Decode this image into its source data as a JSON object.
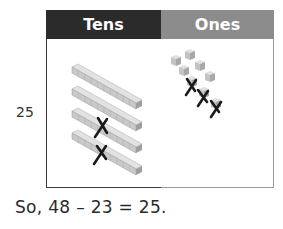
{
  "table": {
    "headers": [
      {
        "label": "Tens",
        "color": "#2b2b2b"
      },
      {
        "label": "Ones",
        "color": "#8c8c8c"
      }
    ],
    "row_label": "25",
    "tens": {
      "rods_total": 4,
      "rods_crossed_out": 2
    },
    "ones": {
      "cubes_total": 8,
      "cubes_crossed_out": 3
    }
  },
  "equation": "So, 48 – 23 = 25."
}
